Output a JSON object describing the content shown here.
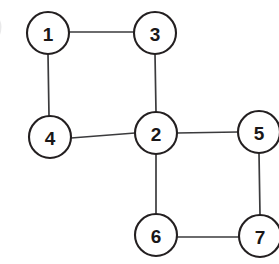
{
  "diagram": {
    "type": "node-link-graph",
    "background_color": "#ffffff",
    "node_fill_color": "#ffffff",
    "node_stroke_color": "#231f20",
    "edge_color": "#3b3b3d",
    "label_color": "#1a1718",
    "node_radius": 21,
    "nodes": [
      {
        "id": "1",
        "label": "1",
        "cx": 48,
        "cy": 33,
        "r": 21
      },
      {
        "id": "2",
        "label": "2",
        "cx": 156,
        "cy": 133,
        "r": 21
      },
      {
        "id": "3",
        "label": "3",
        "cx": 155,
        "cy": 33,
        "r": 21
      },
      {
        "id": "4",
        "label": "4",
        "cx": 50,
        "cy": 137,
        "r": 21
      },
      {
        "id": "5",
        "label": "5",
        "cx": 259,
        "cy": 132,
        "r": 21
      },
      {
        "id": "6",
        "label": "6",
        "cx": 156,
        "cy": 235,
        "r": 21
      },
      {
        "id": "7",
        "label": "7",
        "cx": 260,
        "cy": 236,
        "r": 21
      }
    ],
    "edges": [
      {
        "id": "edge-1-3",
        "from": "1",
        "to": "3",
        "x1": 69,
        "y1": 32,
        "x2": 134,
        "y2": 32
      },
      {
        "id": "edge-1-4",
        "from": "1",
        "to": "4",
        "x1": 48,
        "y1": 54,
        "x2": 49,
        "y2": 116
      },
      {
        "id": "edge-3-2",
        "from": "3",
        "to": "2",
        "x1": 155,
        "y1": 54,
        "x2": 156,
        "y2": 112
      },
      {
        "id": "edge-4-2",
        "from": "4",
        "to": "2",
        "x1": 71,
        "y1": 138,
        "x2": 135,
        "y2": 133
      },
      {
        "id": "edge-2-5",
        "from": "2",
        "to": "5",
        "x1": 177,
        "y1": 133,
        "x2": 238,
        "y2": 132
      },
      {
        "id": "edge-2-6",
        "from": "2",
        "to": "6",
        "x1": 156,
        "y1": 154,
        "x2": 156,
        "y2": 214
      },
      {
        "id": "edge-5-7",
        "from": "5",
        "to": "7",
        "x1": 259,
        "y1": 153,
        "x2": 260,
        "y2": 215
      },
      {
        "id": "edge-6-7",
        "from": "6",
        "to": "7",
        "x1": 177,
        "y1": 237,
        "x2": 239,
        "y2": 237
      }
    ]
  }
}
